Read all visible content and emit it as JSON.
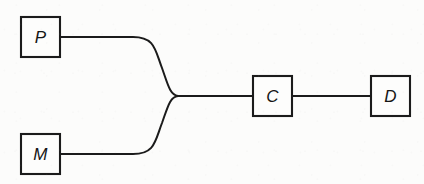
{
  "figure": {
    "domain_kind": "block-diagram",
    "width": 424,
    "height": 184,
    "background_color": "#fcfcfb",
    "stroke_color": "#1b1b1b",
    "label_style": "italic"
  },
  "nodes": [
    {
      "id": "P",
      "label": "P",
      "x": 21,
      "y": 17,
      "width": 39,
      "height": 40,
      "center_x": 40.5,
      "center_y": 37
    },
    {
      "id": "M",
      "label": "M",
      "x": 21,
      "y": 134,
      "width": 39,
      "height": 40,
      "center_x": 40.5,
      "center_y": 154
    },
    {
      "id": "C",
      "label": "C",
      "x": 253,
      "y": 76,
      "width": 39,
      "height": 40,
      "center_x": 272.5,
      "center_y": 96
    },
    {
      "id": "D",
      "label": "D",
      "x": 371,
      "y": 76,
      "width": 39,
      "height": 40,
      "center_x": 390.5,
      "center_y": 96
    }
  ],
  "junction": {
    "label": "merge-point",
    "x": 178,
    "y": 96
  },
  "edges": [
    {
      "id": "p-to-junction",
      "from": "P",
      "to": "junction",
      "shape": "s-curve",
      "path": "M 60 37 L 133 37 C 155 37 155 50 162 68 C 168 85 170 95 178 96"
    },
    {
      "id": "m-to-junction",
      "from": "M",
      "to": "junction",
      "shape": "s-curve",
      "path": "M 60 154 L 133 154 C 155 154 155 141 162 123 C 168 106 170 97 178 96"
    },
    {
      "id": "junction-to-c",
      "from": "junction",
      "to": "C",
      "shape": "straight",
      "path": "M 178 96 L 253 96"
    },
    {
      "id": "c-to-d",
      "from": "C",
      "to": "D",
      "shape": "straight",
      "path": "M 292 96 L 371 96"
    }
  ]
}
